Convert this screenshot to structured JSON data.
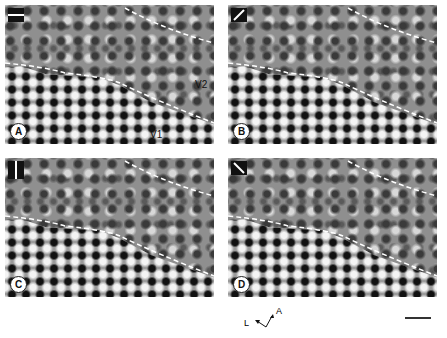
{
  "figure": {
    "panels": [
      {
        "id": "A",
        "orientation": "horizontal",
        "labels": [
          "V2",
          "V1"
        ]
      },
      {
        "id": "B",
        "orientation": "oblique-45"
      },
      {
        "id": "C",
        "orientation": "vertical"
      },
      {
        "id": "D",
        "orientation": "oblique-135"
      }
    ],
    "areas": {
      "v2": "V2",
      "v1": "V1"
    },
    "compass": {
      "lateral": "L",
      "anterior": "A"
    },
    "scale_bar": true
  }
}
